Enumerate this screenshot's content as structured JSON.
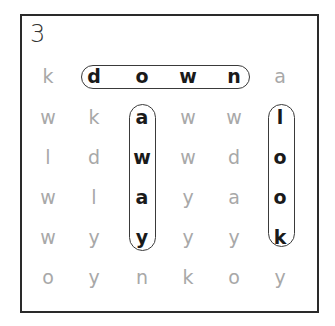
{
  "puzzle": {
    "number": "3",
    "grid": [
      [
        "k",
        "d",
        "o",
        "w",
        "n",
        "a"
      ],
      [
        "w",
        "k",
        "a",
        "w",
        "w",
        "l"
      ],
      [
        "l",
        "d",
        "w",
        "w",
        "d",
        "o"
      ],
      [
        "w",
        "l",
        "a",
        "y",
        "a",
        "o"
      ],
      [
        "w",
        "y",
        "y",
        "y",
        "y",
        "k"
      ],
      [
        "o",
        "y",
        "n",
        "k",
        "o",
        "y"
      ]
    ],
    "found_words": [
      {
        "word": "down",
        "direction": "horizontal",
        "row": 0,
        "start_col": 1,
        "end_col": 4
      },
      {
        "word": "away",
        "direction": "vertical",
        "col": 2,
        "start_row": 1,
        "end_row": 4
      },
      {
        "word": "look",
        "direction": "vertical",
        "col": 5,
        "start_row": 1,
        "end_row": 4
      }
    ],
    "colors": {
      "found_letter": "#1a1a1a",
      "dim_letter": "#a8a8a8",
      "frame": "#2a2a2a",
      "highlight_border": "#3a3a3a"
    }
  }
}
